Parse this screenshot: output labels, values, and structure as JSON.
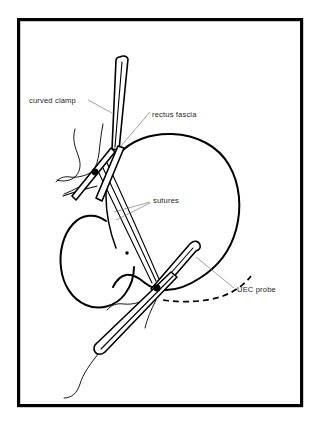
{
  "figure": {
    "kind": "surgical-illustration",
    "title_visible": false,
    "background_color": "#ffffff",
    "ink_color": "#000000",
    "leader_color": "#6e6e73",
    "frame": {
      "name": "figure-border",
      "x": 17,
      "y": 18,
      "width": 286,
      "height": 389,
      "stroke_width": 3.2
    },
    "labels": [
      {
        "id": "curved-clamp",
        "text": "curved clamp",
        "x": 29,
        "y": 103,
        "anchor": "start",
        "leader": "M 88 100 L 112 113"
      },
      {
        "id": "rectus-fascia",
        "text": "rectus fascia",
        "x": 152,
        "y": 117,
        "anchor": "start",
        "leader": "M 150 112 L 121 146"
      },
      {
        "id": "sutures",
        "text": "sutures",
        "x": 153,
        "y": 203,
        "anchor": "start",
        "leader_a": "M 150 202 L 114 212",
        "leader_b": "M 150 203 L 116 220"
      },
      {
        "id": "uec-probe",
        "text": "UEC probe",
        "x": 237,
        "y": 292,
        "anchor": "start",
        "leader": "M 234 288 L 196 257"
      }
    ],
    "structures": [
      {
        "id": "bladder",
        "label_ref": null,
        "note": "large rounded viscus, right of midline"
      },
      {
        "id": "vaginal-wall",
        "label_ref": null,
        "note": "oval structure, lower left"
      },
      {
        "id": "rectus-fascia-strip",
        "label_ref": "rectus-fascia",
        "note": "narrow sling strip"
      },
      {
        "id": "upper-knot",
        "label_ref": null,
        "note": "suture crossing point, upper left"
      },
      {
        "id": "lower-knot",
        "label_ref": null,
        "note": "suture crossing point, lower center"
      },
      {
        "id": "probe-track",
        "label_ref": "uec-probe",
        "note": "dashed trajectory line"
      }
    ],
    "instruments": [
      {
        "id": "curved-clamp",
        "label_ref": "curved clamp",
        "note": "long clamp entering from top"
      },
      {
        "id": "uec-probe",
        "label_ref": "UEC probe",
        "note": "rod with rounded tip, from right"
      },
      {
        "id": "lower-clamp",
        "label_ref": null,
        "note": "clamp exiting to lower left"
      }
    ]
  }
}
